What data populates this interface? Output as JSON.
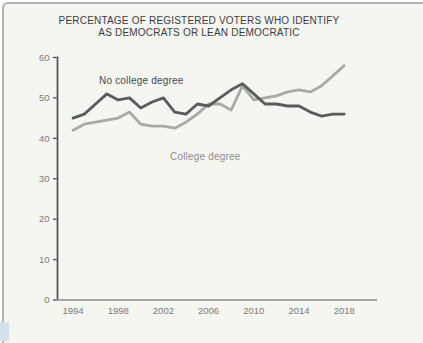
{
  "title": {
    "line1": "PERCENTAGE OF REGISTERED VOTERS WHO IDENTIFY",
    "line2": "AS DEMOCRATS OR LEAN DEMOCRATIC"
  },
  "panel": {
    "background": "#f5f5f2",
    "border_color": "#b2b2b0"
  },
  "axis": {
    "line_color_y": "#4e4f51",
    "line_color_x": "#8a8a88",
    "tick_label_color": "#7b7b79"
  },
  "chart_data": {
    "type": "line",
    "title": "PERCENTAGE OF REGISTERED VOTERS WHO IDENTIFY AS DEMOCRATS OR LEAN DEMOCRATIC",
    "xlabel": "",
    "ylabel": "",
    "grid": false,
    "legend": "inline-labels",
    "ylim": [
      0,
      60
    ],
    "y_ticks": [
      0,
      10,
      20,
      30,
      40,
      50,
      60
    ],
    "x_tick_labels": [
      "1994",
      "1998",
      "2002",
      "2006",
      "2010",
      "2014",
      "2018"
    ],
    "x": [
      1994,
      1995,
      1996,
      1997,
      1998,
      1999,
      2000,
      2001,
      2002,
      2003,
      2004,
      2005,
      2006,
      2007,
      2008,
      2009,
      2010,
      2011,
      2012,
      2013,
      2014,
      2015,
      2016,
      2017,
      2018
    ],
    "series": [
      {
        "name": "No college degree",
        "color": "#5a5b5d",
        "label_color": "#47484a",
        "values": [
          45,
          46,
          48.5,
          51,
          49.5,
          50,
          47.5,
          49,
          50,
          46.5,
          46,
          48.5,
          48,
          50,
          52,
          53.5,
          51,
          48.5,
          48.5,
          48,
          48,
          46.5,
          45.5,
          46,
          46
        ]
      },
      {
        "name": "College degree",
        "color": "#a9aaa7",
        "label_color": "#8e8f8d",
        "values": [
          42,
          43.5,
          44,
          44.5,
          45,
          46.5,
          43.5,
          43,
          43,
          42.5,
          44,
          46,
          48.5,
          48.5,
          47,
          53,
          49.5,
          50,
          50.5,
          51.5,
          52,
          51.5,
          53,
          55.5,
          58
        ]
      }
    ]
  }
}
